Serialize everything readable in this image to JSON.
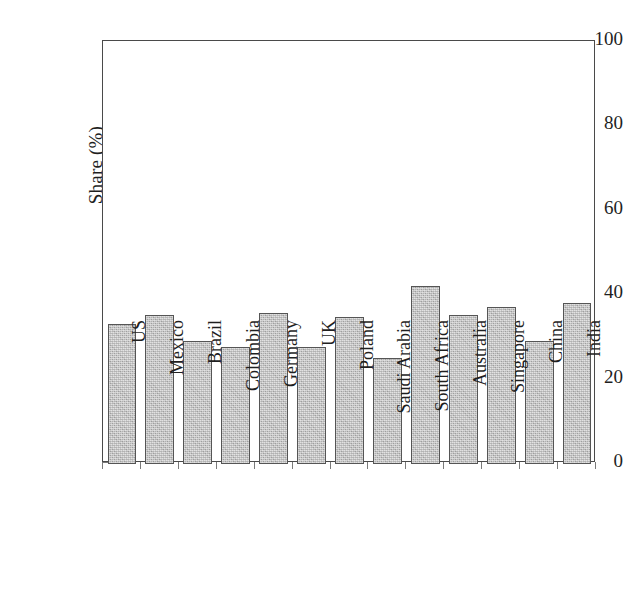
{
  "chart_data": {
    "type": "bar",
    "title": "",
    "subtitle": "",
    "xlabel": "",
    "ylabel": "Share (%)",
    "ylim": [
      0,
      100
    ],
    "yticks": [
      0,
      20,
      40,
      60,
      80,
      100
    ],
    "ytick_labels": [
      "0",
      "20",
      "40",
      "60",
      "80",
      "100"
    ],
    "grid": false,
    "legend": false,
    "legend_position": "none",
    "bar_color": "#bebebe",
    "bar_edge_color": "#555555",
    "axis_color": "#4a4a4a",
    "background_color": "#ffffff",
    "categories": [
      "US",
      "Mexico",
      "Brazil",
      "Colombia",
      "Germany",
      "UK",
      "Poland",
      "Saudi Arabia",
      "South Africa",
      "Australia",
      "Singapore",
      "China",
      "India"
    ],
    "values": [
      33,
      35,
      29,
      27.5,
      35.5,
      27.5,
      34.5,
      25,
      42,
      35,
      37,
      29,
      38
    ]
  }
}
